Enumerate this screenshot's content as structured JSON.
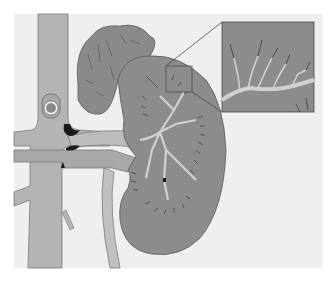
{
  "diagram": {
    "parts": [
      "adrenal-gland",
      "kidney",
      "renal-artery",
      "renal-vein",
      "aorta",
      "vena-cava",
      "ureter",
      "magnified-inset"
    ],
    "colors": {
      "page": "#ffffff",
      "panel": "#efefef",
      "vessel": "#b4b4b4",
      "kidney": "#8c8c8c",
      "adrenal": "#8a8a8a",
      "outline": "#5a5a5a",
      "branch": "#d0d0d0",
      "dark": "#1a1a1a"
    }
  }
}
